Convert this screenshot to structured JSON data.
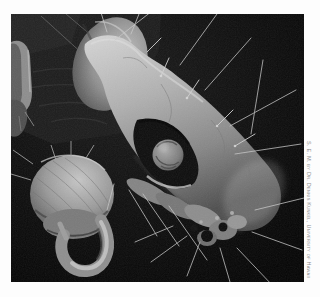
{
  "figure": {
    "type": "scanning electron micrograph",
    "credit": "S. E. M. by Dr. Dennis Kunkel, University of Hawaii",
    "colors": {
      "page_background": "#fdfdfd",
      "photo_background": "#0a0a0a",
      "specimen_highlight": "#d6d6d6",
      "specimen_midtone": "#9a9a9a",
      "specimen_shadow": "#4a4a4a",
      "credit_text": "#8e8e8e"
    }
  }
}
